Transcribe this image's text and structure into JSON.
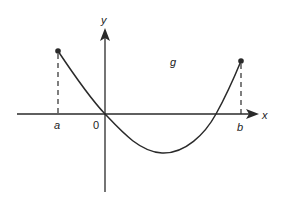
{
  "figure": {
    "title": "",
    "function_label": "g",
    "x_axis_label": "x",
    "y_axis_label": "y",
    "origin_label": "0",
    "left_bound_label": "a",
    "right_bound_label": "b",
    "colors": {
      "stroke": "#2a2a2a",
      "background": "#ffffff"
    }
  }
}
